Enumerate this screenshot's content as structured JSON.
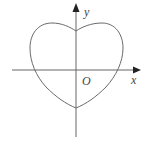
{
  "diagram": {
    "type": "coordinate-plot",
    "colors": {
      "background": "#ffffff",
      "stroke": "#6a6a6a",
      "axis": "#555555",
      "arrow": "#222222",
      "label": "#444444"
    },
    "labels": {
      "x_axis": "x",
      "y_axis": "y",
      "origin": "O"
    },
    "curve": {
      "shape": "heart",
      "top_cusp": "on positive y-axis",
      "bottom_point": "on negative y-axis",
      "symmetric_about": "y-axis"
    }
  }
}
